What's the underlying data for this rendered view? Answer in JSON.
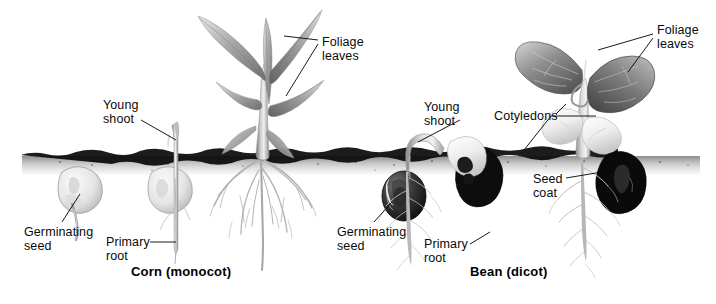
{
  "figure": {
    "background_color": "#ffffff",
    "ink_color": "#000000",
    "soil_color": "#111111",
    "width": 716,
    "height": 304
  },
  "panels": [
    {
      "id": "corn",
      "caption": "Corn (monocot)",
      "caption_x": 131,
      "caption_y": 264,
      "stages": 3
    },
    {
      "id": "bean",
      "caption": "Bean (dicot)",
      "caption_x": 470,
      "caption_y": 264,
      "stages": 3
    }
  ],
  "labels": [
    {
      "name": "foliage-leaves-corn",
      "lines": [
        "Foliage",
        "leaves"
      ],
      "x": 322,
      "y": 36,
      "panel": "corn"
    },
    {
      "name": "young-shoot-corn",
      "lines": [
        "Young",
        "shoot"
      ],
      "x": 103,
      "y": 99,
      "panel": "corn"
    },
    {
      "name": "germinating-seed-corn",
      "lines": [
        "Germinating",
        "seed"
      ],
      "x": 24,
      "y": 226,
      "panel": "corn"
    },
    {
      "name": "primary-root-corn",
      "lines": [
        "Primary",
        "root"
      ],
      "x": 106,
      "y": 236,
      "panel": "corn"
    },
    {
      "name": "foliage-leaves-bean",
      "lines": [
        "Foliage",
        "leaves"
      ],
      "x": 657,
      "y": 24,
      "panel": "bean"
    },
    {
      "name": "young-shoot-bean",
      "lines": [
        "Young",
        "shoot"
      ],
      "x": 424,
      "y": 101,
      "panel": "bean"
    },
    {
      "name": "cotyledons-bean",
      "lines": [
        "Cotyledons"
      ],
      "x": 494,
      "y": 110,
      "panel": "bean"
    },
    {
      "name": "seed-coat-bean",
      "lines": [
        "Seed",
        "coat"
      ],
      "x": 533,
      "y": 173,
      "panel": "bean"
    },
    {
      "name": "germinating-seed-bean",
      "lines": [
        "Germinating",
        "seed"
      ],
      "x": 337,
      "y": 226,
      "panel": "bean"
    },
    {
      "name": "primary-root-bean",
      "lines": [
        "Primary",
        "root"
      ],
      "x": 424,
      "y": 238,
      "panel": "bean"
    }
  ],
  "soil_line": {
    "y": 154,
    "left": 18,
    "right": 700,
    "thickness": 5
  }
}
